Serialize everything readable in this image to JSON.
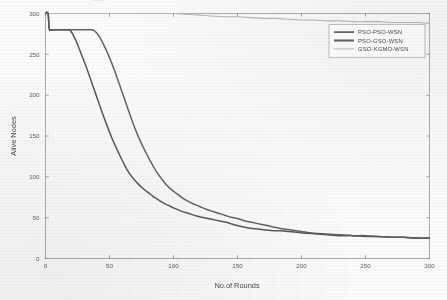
{
  "figure": {
    "cropped_caption": "......",
    "background_hex": "#fbfbfa"
  },
  "chart_data": {
    "type": "line",
    "title": "",
    "xlabel": "No.of Rounds",
    "ylabel": "Alive Nodes",
    "xlim": [
      0,
      300
    ],
    "ylim": [
      0,
      300
    ],
    "xticks": [
      0,
      50,
      100,
      150,
      200,
      250,
      300
    ],
    "yticks": [
      0,
      50,
      100,
      150,
      200,
      250,
      300
    ],
    "xtick_labels": [
      "0",
      "50",
      "100",
      "150",
      "200",
      "250",
      "300"
    ],
    "ytick_labels": [
      "0",
      "50",
      "100",
      "150",
      "200",
      "250",
      "300"
    ],
    "grid": false,
    "frame": true,
    "legend_position": "upper right",
    "series": [
      {
        "name": "PSO-PSO-WSN",
        "color": "#595959",
        "width": 1.5,
        "x": [
          0,
          2,
          3,
          5,
          10,
          14,
          18,
          20,
          24,
          28,
          32,
          36,
          40,
          44,
          48,
          52,
          56,
          60,
          64,
          68,
          72,
          76,
          80,
          84,
          88,
          92,
          96,
          100,
          106,
          112,
          118,
          124,
          130,
          136,
          142,
          148,
          154,
          160,
          166,
          172,
          178,
          184,
          190,
          196,
          204,
          212,
          220,
          230,
          240,
          250,
          260,
          270,
          280,
          290,
          300
        ],
        "values": [
          300,
          300,
          281,
          280,
          280,
          280,
          280,
          278,
          266,
          250,
          234,
          216,
          198,
          180,
          163,
          147,
          133,
          120,
          108,
          99,
          92,
          86,
          81,
          76,
          72,
          68,
          65,
          62,
          58,
          55,
          52,
          50,
          48,
          46,
          44,
          41,
          39,
          37,
          36,
          35,
          34,
          34,
          33,
          32,
          31,
          30,
          29,
          28,
          28,
          27,
          27,
          26,
          26,
          25,
          25
        ]
      },
      {
        "name": "PSO-GSO-WSN",
        "color": "#646464",
        "width": 1.5,
        "x": [
          0,
          2,
          3,
          5,
          10,
          16,
          22,
          28,
          34,
          38,
          42,
          46,
          50,
          54,
          58,
          62,
          66,
          70,
          74,
          78,
          82,
          86,
          90,
          94,
          98,
          102,
          108,
          114,
          120,
          126,
          132,
          138,
          144,
          150,
          156,
          162,
          168,
          174,
          180,
          186,
          192,
          200,
          210,
          220,
          230,
          240,
          250,
          260,
          270,
          280,
          290,
          300
        ],
        "values": [
          300,
          300,
          281,
          280,
          280,
          280,
          280,
          280,
          280,
          279,
          272,
          260,
          246,
          230,
          212,
          194,
          176,
          159,
          144,
          131,
          119,
          108,
          99,
          91,
          85,
          80,
          73,
          68,
          64,
          60,
          57,
          54,
          51,
          49,
          46,
          44,
          42,
          40,
          38,
          36,
          35,
          33,
          31,
          30,
          29,
          28,
          28,
          27,
          26,
          26,
          25,
          25
        ]
      },
      {
        "name": "GSO-KGMO-WSN",
        "color": "#b5b5b5",
        "width": 1.1,
        "x": [
          0,
          20,
          40,
          60,
          80,
          100,
          110,
          120,
          130,
          140,
          150,
          160,
          170,
          180,
          190,
          200,
          210,
          220,
          230,
          240,
          250,
          260,
          270,
          280,
          290,
          300
        ],
        "values": [
          300,
          300,
          300,
          300,
          300,
          300,
          299,
          298,
          297,
          296,
          296,
          295,
          294,
          294,
          293,
          292,
          292,
          291,
          291,
          290,
          290,
          290,
          289,
          289,
          289,
          288
        ]
      }
    ]
  },
  "legend": {
    "entries": [
      {
        "label": "PSO-PSO-WSN",
        "color": "#595959",
        "width": 1.6
      },
      {
        "label": "PSO-GSO-WSN",
        "color": "#646464",
        "width": 2.1
      },
      {
        "label": "GSO-KGMO-WSN",
        "color": "#b9b9b9",
        "width": 1.0
      }
    ]
  },
  "axes": {
    "x_title": "No.of Rounds",
    "y_title": "Alive Nodes"
  }
}
